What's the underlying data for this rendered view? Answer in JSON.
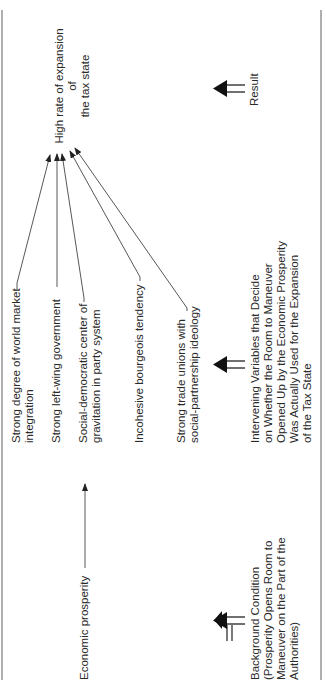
{
  "diagram": {
    "result": {
      "label": "High rate of expansion",
      "label_line2": "of",
      "label_line3": "the tax state"
    },
    "intervening_variables": [
      {
        "line1": "Strong degree of world market",
        "line2": "integration"
      },
      {
        "line1": "Strong left-wing government",
        "line2": ""
      },
      {
        "line1": "Social-democratic center of",
        "line2": "gravitation in party system"
      },
      {
        "line1": "Incohesive bourgeois tendency",
        "line2": ""
      },
      {
        "line1": "Strong trade unions with",
        "line2": "social-partnership ideology"
      }
    ],
    "background_variable": {
      "label": "Economic prosperity"
    },
    "legend": {
      "result": {
        "label": "Result"
      },
      "intervening": {
        "lines": [
          "Intervening Variables that Decide",
          "on Whether the Room to Maneuver",
          "Opened Up by the Economic Prosperity",
          "Was Actually Used for the Expansion",
          "of the Tax State"
        ]
      },
      "background": {
        "lines": [
          "Background Condition",
          "(Prosperity Opens Room to",
          "Maneuver on the Part of the",
          "Authorities)"
        ]
      }
    },
    "colors": {
      "ink": "#2a2a2a",
      "border": "#7a7a7a",
      "background": "#ffffff"
    }
  }
}
